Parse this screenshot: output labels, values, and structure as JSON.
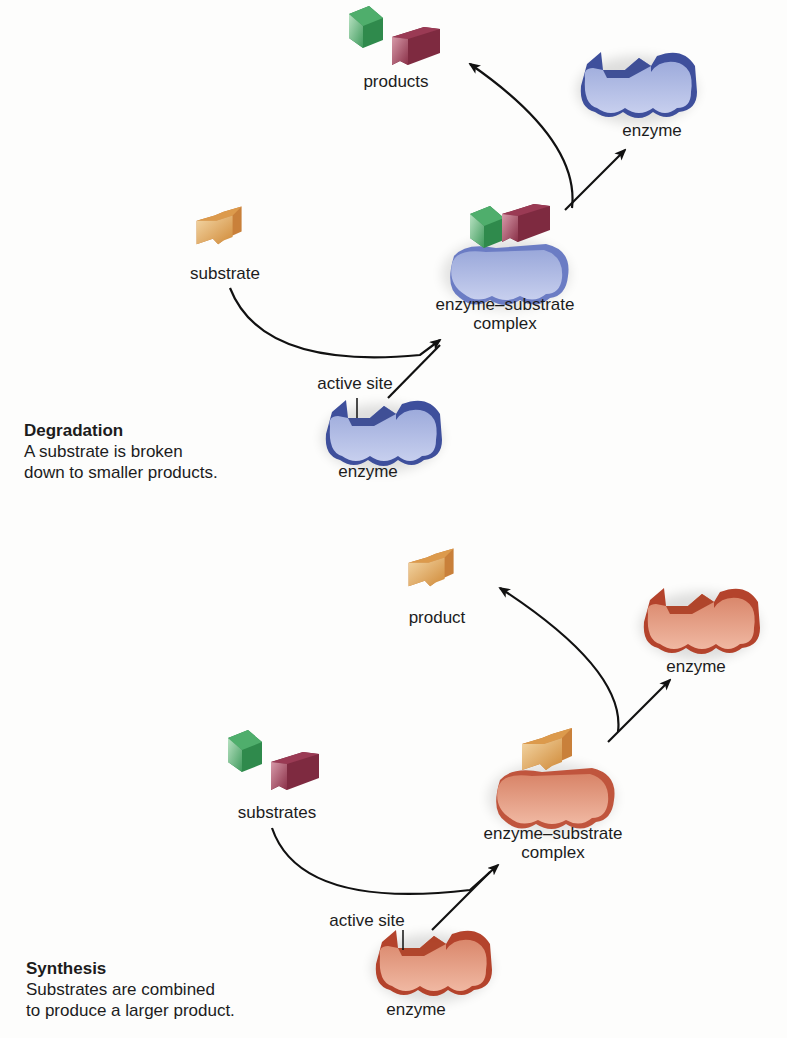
{
  "colors": {
    "background": "#fdfdfc",
    "enzyme_degradation": "#8a9ad0",
    "enzyme_degradation_dark": "#3a4b98",
    "enzyme_synthesis": "#d98a6e",
    "enzyme_synthesis_dark": "#b5412b",
    "green_block": "#5fb57a",
    "maroon_block": "#a64a62",
    "orange_block": "#e3a95c",
    "arrow": "#111111"
  },
  "degradation": {
    "title": "Degradation",
    "description": "A substrate is broken\ndown to smaller products.",
    "labels": {
      "products": "products",
      "enzyme_released": "enzyme",
      "substrate": "substrate",
      "complex_line1": "enzyme–substrate",
      "complex_line2": "complex",
      "active_site": "active site",
      "enzyme_initial": "enzyme"
    }
  },
  "synthesis": {
    "title": "Synthesis",
    "description": "Substrates  are combined\nto produce a larger product.",
    "labels": {
      "product": "product",
      "enzyme_released": "enzyme",
      "substrates": "substrates",
      "complex_line1": "enzyme–substrate",
      "complex_line2": "complex",
      "active_site": "active site",
      "enzyme_initial": "enzyme"
    }
  }
}
